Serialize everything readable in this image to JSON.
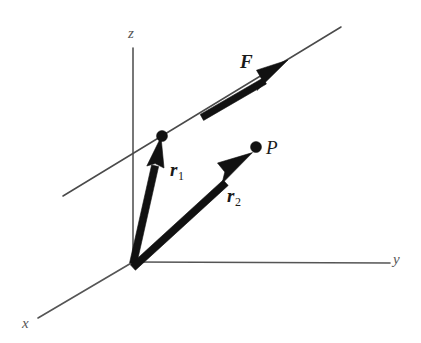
{
  "figure": {
    "type": "vector-diagram",
    "background_color": "#ffffff",
    "ink_color": "#111111",
    "axis_color": "#555555",
    "width": 421,
    "height": 343
  },
  "axes": [
    {
      "id": "z",
      "label": "z",
      "label_x": 128,
      "label_y": 26,
      "from": [
        133,
        262
      ],
      "to": [
        133,
        48
      ]
    },
    {
      "id": "y",
      "label": "y",
      "label_x": 393,
      "label_y": 252,
      "from": [
        133,
        262
      ],
      "to": [
        390,
        263
      ]
    },
    {
      "id": "x",
      "label": "x",
      "label_x": 22,
      "label_y": 316,
      "from": [
        133,
        262
      ],
      "to": [
        38,
        318
      ]
    }
  ],
  "line_of_action": {
    "name": "line-of-action",
    "from": [
      63,
      196
    ],
    "to": [
      341,
      27
    ],
    "color": "#4a4a4a"
  },
  "vectors": [
    {
      "id": "F",
      "label": "F",
      "subscript": "",
      "label_x": 240,
      "label_y": 52,
      "tail": [
        201,
        111
      ],
      "tip": [
        287,
        61
      ],
      "style": "bold-arrow",
      "shaft_width": 7,
      "head_length": 26,
      "head_width": 17
    },
    {
      "id": "r1",
      "label": "r",
      "subscript": "1",
      "label_x": 170,
      "label_y": 160,
      "tail": [
        133,
        262
      ],
      "tip": [
        161,
        139
      ],
      "style": "bold-arrow",
      "shaft_width": 7,
      "head_length": 28,
      "head_width": 15
    },
    {
      "id": "r2",
      "label": "r",
      "subscript": "2",
      "label_x": 227,
      "label_y": 186,
      "tail": [
        133,
        262
      ],
      "tip": [
        252,
        153
      ],
      "style": "bold-arrow",
      "shaft_width": 7,
      "head_length": 26,
      "head_width": 16
    }
  ],
  "points": [
    {
      "id": "point-on-line",
      "label": "",
      "x": 162,
      "y": 136,
      "radius": 5.5
    },
    {
      "id": "P",
      "label": "P",
      "label_x": 266,
      "label_y": 138,
      "x": 256,
      "y": 147,
      "radius": 5.5
    }
  ]
}
